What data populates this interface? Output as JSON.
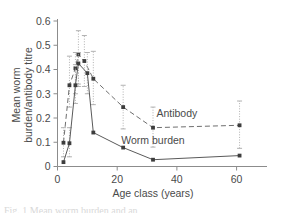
{
  "chart_data": {
    "type": "line",
    "title": "",
    "xlabel": "Age class (years)",
    "ylabel": "Mean worm burden/antibody titre",
    "ylabel_line1": "Mean worm",
    "ylabel_line2": "burden/antibody titre",
    "xlim": [
      0,
      65
    ],
    "ylim": [
      0,
      0.6
    ],
    "xticks": [
      0,
      20,
      40,
      60
    ],
    "xtick_labels": [
      "0",
      "20",
      "40",
      "60"
    ],
    "yticks": [
      0,
      0.1,
      0.2,
      0.3,
      0.4,
      0.5,
      0.6
    ],
    "ytick_labels": [
      "0",
      "0.1",
      "0.2",
      "0.3",
      "0.4",
      "0.5",
      "0.6"
    ],
    "grid": false,
    "legend_position": "inline-annotation",
    "series": [
      {
        "name": "Antibody",
        "linestyle": "dashed",
        "color": "#6e6e6e",
        "marker": "square",
        "x": [
          2,
          4,
          6,
          7,
          9,
          12,
          22,
          32,
          61
        ],
        "values": [
          0.098,
          0.335,
          0.405,
          0.462,
          0.435,
          0.362,
          0.245,
          0.16,
          0.17
        ],
        "error_low": [
          0.04,
          0.245,
          0.3,
          0.34,
          0.33,
          0.255,
          0.155,
          0.08,
          0.075
        ],
        "error_high": [
          0.16,
          0.455,
          0.47,
          0.56,
          0.54,
          0.475,
          0.335,
          0.245,
          0.27
        ]
      },
      {
        "name": "Worm burden",
        "linestyle": "solid",
        "color": "#5a5a5a",
        "marker": "square",
        "x": [
          2,
          4,
          6,
          7,
          10,
          12,
          22,
          32,
          61
        ],
        "values": [
          0.018,
          0.096,
          0.335,
          0.425,
          0.385,
          0.14,
          0.078,
          0.028,
          0.045
        ],
        "error_low": [
          0.018,
          0.04,
          0.26,
          0.33,
          0.3,
          0.14,
          0.078,
          0.028,
          0.045
        ],
        "error_high": [
          0.018,
          0.16,
          0.42,
          0.47,
          0.47,
          0.14,
          0.078,
          0.028,
          0.045
        ]
      }
    ],
    "annotations": [
      {
        "text": "Antibody",
        "x": 40,
        "y": 0.205
      },
      {
        "text": "Worm burden",
        "x": 32,
        "y": 0.092
      }
    ]
  },
  "caption": {
    "text": "Fig. 1  Mean worm burden and an"
  }
}
